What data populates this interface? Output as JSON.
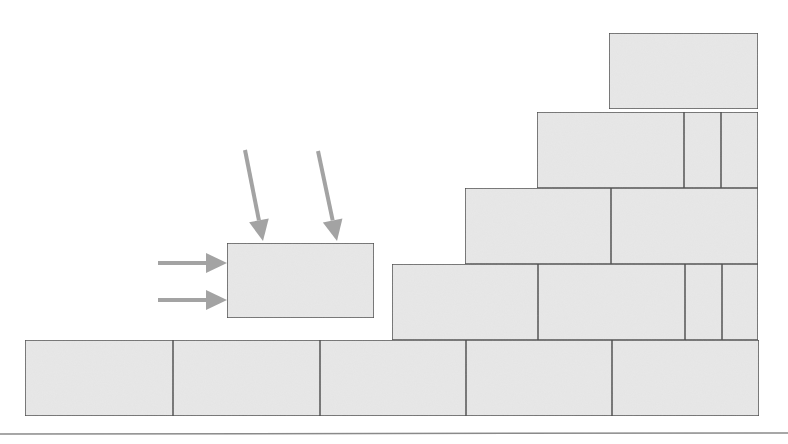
{
  "diagram": {
    "width": 788,
    "height": 444,
    "colors": {
      "background": "#ffffff",
      "block_fill": "#e8e8e8",
      "block_stroke": "#444444",
      "arrow": "#a3a3a3",
      "ground": "#8a8a8a"
    },
    "ground_line": {
      "x1": 0,
      "y1": 434,
      "x2": 788,
      "y2": 433
    },
    "stepped_wall": {
      "rows": [
        {
          "name": "row-1-bottom",
          "y": 340,
          "h": 76,
          "blocks": [
            {
              "x": 25,
              "w": 148
            },
            {
              "x": 173,
              "w": 147
            },
            {
              "x": 320,
              "w": 146
            },
            {
              "x": 466,
              "w": 146
            },
            {
              "x": 612,
              "w": 147
            }
          ]
        },
        {
          "name": "row-2",
          "y": 264,
          "h": 76,
          "blocks": [
            {
              "x": 392,
              "w": 146
            },
            {
              "x": 538,
              "w": 147
            },
            {
              "x": 685,
              "w": 37
            },
            {
              "x": 722,
              "w": 36
            }
          ]
        },
        {
          "name": "row-3",
          "y": 188,
          "h": 76,
          "blocks": [
            {
              "x": 465,
              "w": 146
            },
            {
              "x": 611,
              "w": 147
            }
          ]
        },
        {
          "name": "row-4",
          "y": 112,
          "h": 76,
          "blocks": [
            {
              "x": 537,
              "w": 147
            },
            {
              "x": 684,
              "w": 37
            },
            {
              "x": 721,
              "w": 37
            }
          ]
        },
        {
          "name": "row-5-top",
          "y": 33,
          "h": 76,
          "blocks": [
            {
              "x": 609,
              "w": 149
            }
          ]
        }
      ]
    },
    "loose_block": {
      "x": 227,
      "y": 243,
      "w": 147,
      "h": 75
    },
    "arrows": [
      {
        "name": "arrow-horizontal-upper",
        "x1": 158,
        "y1": 263,
        "x2": 227,
        "y2": 263
      },
      {
        "name": "arrow-horizontal-lower",
        "x1": 158,
        "y1": 300,
        "x2": 227,
        "y2": 300
      },
      {
        "name": "arrow-diagonal-left",
        "x1": 245,
        "y1": 150,
        "x2": 263,
        "y2": 241
      },
      {
        "name": "arrow-diagonal-right",
        "x1": 318,
        "y1": 151,
        "x2": 337,
        "y2": 241
      }
    ]
  }
}
